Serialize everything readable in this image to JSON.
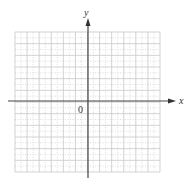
{
  "diagram": {
    "type": "coordinate-plane",
    "axes": {
      "x_label": "x",
      "y_label": "y",
      "origin_label": "0"
    },
    "grid": {
      "columns": 12,
      "rows": 12,
      "subdivisions": 2,
      "x_range": [
        -6,
        6
      ],
      "y_range": [
        -6,
        6
      ]
    },
    "colors": {
      "grid_major": "#c8c8c8",
      "grid_minor": "#d6d6d6",
      "axis": "#444444",
      "background": "#ffffff"
    }
  }
}
